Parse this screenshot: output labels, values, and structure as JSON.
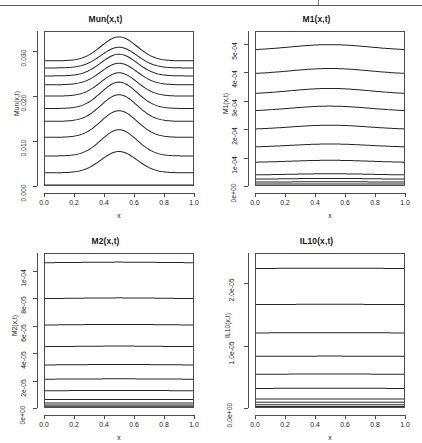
{
  "figure": {
    "kind": "r-multipanel-figure",
    "panel_grid": "2x2",
    "footer_fragment": "",
    "line_color": "#262626",
    "axis_color": "#4d4d4d",
    "background": "#ffffff"
  },
  "chart_data": [
    {
      "id": "mun",
      "type": "line",
      "title": "Mun(x,t)",
      "xlabel": "x",
      "ylabel": "Mun(x,t)",
      "xlim": [
        0.0,
        1.0
      ],
      "ylim": [
        0.0,
        0.0345
      ],
      "grid": false,
      "legend": "none",
      "xticks": [
        "0.0",
        "0.2",
        "0.4",
        "0.6",
        "0.8",
        "1.0"
      ],
      "xtick_values": [
        0.0,
        0.2,
        0.4,
        0.6,
        0.8,
        1.0
      ],
      "yticks": [
        "0.000",
        "0.010",
        "0.020",
        "0.030"
      ],
      "ytick_values": [
        0.0,
        0.01,
        0.02,
        0.03
      ],
      "x": [
        0.0,
        0.05,
        0.1,
        0.15,
        0.2,
        0.25,
        0.3,
        0.35,
        0.4,
        0.45,
        0.5,
        0.55,
        0.6,
        0.65,
        0.7,
        0.75,
        0.8,
        0.85,
        0.9,
        0.95,
        1.0
      ],
      "series": [
        {
          "name": "t0",
          "baseline": 0.0,
          "peak": 0.0
        },
        {
          "name": "t1",
          "baseline": 0.00275,
          "peak": 0.00755
        },
        {
          "name": "t2",
          "baseline": 0.00655,
          "peak": 0.01245
        },
        {
          "name": "t3",
          "baseline": 0.01075,
          "peak": 0.01675
        },
        {
          "name": "t4",
          "baseline": 0.01435,
          "peak": 0.02035
        },
        {
          "name": "t5",
          "baseline": 0.01725,
          "peak": 0.0232
        },
        {
          "name": "t6",
          "baseline": 0.02005,
          "peak": 0.0253
        },
        {
          "name": "t7",
          "baseline": 0.0226,
          "peak": 0.02745
        },
        {
          "name": "t8",
          "baseline": 0.0246,
          "peak": 0.0295
        },
        {
          "name": "t9",
          "baseline": 0.0264,
          "peak": 0.03105
        },
        {
          "name": "t10",
          "baseline": 0.028,
          "peak": 0.0334
        }
      ]
    },
    {
      "id": "m1",
      "type": "line",
      "title": "M1(x,t)",
      "xlabel": "x",
      "ylabel": "M1(x,t)",
      "xlim": [
        0.0,
        1.0
      ],
      "ylim": [
        0.0,
        0.000545
      ],
      "grid": false,
      "legend": "none",
      "xticks": [
        "0.0",
        "0.2",
        "0.4",
        "0.6",
        "0.8",
        "1.0"
      ],
      "xtick_values": [
        0.0,
        0.2,
        0.4,
        0.6,
        0.8,
        1.0
      ],
      "yticks": [
        "0e+00",
        "1e-04",
        "2e-04",
        "3e-04",
        "4e-04",
        "5e-04"
      ],
      "ytick_values": [
        0.0,
        0.0001,
        0.0002,
        0.0003,
        0.0004,
        0.0005
      ],
      "x": [
        0.0,
        0.05,
        0.1,
        0.15,
        0.2,
        0.25,
        0.3,
        0.35,
        0.4,
        0.45,
        0.5,
        0.55,
        0.6,
        0.65,
        0.7,
        0.75,
        0.8,
        0.85,
        0.9,
        0.95,
        1.0
      ],
      "series": [
        {
          "name": "t0",
          "baseline": 3.5e-06,
          "peak": 3.5e-06
        },
        {
          "name": "t1",
          "baseline": 1.05e-05,
          "peak": 1.15e-05
        },
        {
          "name": "t2",
          "baseline": 2.05e-05,
          "peak": 2.35e-05
        },
        {
          "name": "t3",
          "baseline": 3.55e-05,
          "peak": 4e-05
        },
        {
          "name": "t4",
          "baseline": 8e-05,
          "peak": 8.8e-05
        },
        {
          "name": "t5",
          "baseline": 0.000134,
          "peak": 0.000146
        },
        {
          "name": "t6",
          "baseline": 0.000197,
          "peak": 0.000213
        },
        {
          "name": "t7",
          "baseline": 0.000262,
          "peak": 0.000281
        },
        {
          "name": "t8",
          "baseline": 0.000323,
          "peak": 0.000344
        },
        {
          "name": "t9",
          "baseline": 0.000394,
          "peak": 0.000415
        },
        {
          "name": "t10",
          "baseline": 0.000479,
          "peak": 0.0005
        }
      ]
    },
    {
      "id": "m2",
      "type": "line",
      "title": "M2(x,t)",
      "xlabel": "x",
      "ylabel": "M2(x,t)",
      "xlim": [
        0.0,
        1.0
      ],
      "ylim": [
        0.0,
        0.000113
      ],
      "grid": false,
      "legend": "none",
      "xticks": [
        "0.0",
        "0.2",
        "0.4",
        "0.6",
        "0.8",
        "1.0"
      ],
      "xtick_values": [
        0.0,
        0.2,
        0.4,
        0.6,
        0.8,
        1.0
      ],
      "yticks": [
        "0e+00",
        "2e-05",
        "4e-05",
        "6e-05",
        "8e-05",
        "1e-04"
      ],
      "ytick_values": [
        0.0,
        2e-05,
        4e-05,
        6e-05,
        8e-05,
        0.0001
      ],
      "x": [
        0.0,
        0.05,
        0.1,
        0.15,
        0.2,
        0.25,
        0.3,
        0.35,
        0.4,
        0.45,
        0.5,
        0.55,
        0.6,
        0.65,
        0.7,
        0.75,
        0.8,
        0.85,
        0.9,
        0.95,
        1.0
      ],
      "series": [
        {
          "name": "t0",
          "baseline": 5e-07,
          "peak": 5e-07
        },
        {
          "name": "t1",
          "baseline": 1.5e-06,
          "peak": 1.5e-06
        },
        {
          "name": "t2",
          "baseline": 3e-06,
          "peak": 3e-06
        },
        {
          "name": "t3",
          "baseline": 5.5e-06,
          "peak": 5.5e-06
        },
        {
          "name": "t4",
          "baseline": 1.2e-05,
          "peak": 1.22e-05
        },
        {
          "name": "t5",
          "baseline": 2.05e-05,
          "peak": 2.08e-05
        },
        {
          "name": "t6",
          "baseline": 3.1e-05,
          "peak": 3.14e-05
        },
        {
          "name": "t7",
          "baseline": 4.45e-05,
          "peak": 4.5e-05
        },
        {
          "name": "t8",
          "baseline": 6.05e-05,
          "peak": 6.1e-05
        },
        {
          "name": "t9",
          "baseline": 8e-05,
          "peak": 8.06e-05
        },
        {
          "name": "t10",
          "baseline": 0.0001065,
          "peak": 0.000107
        }
      ]
    },
    {
      "id": "il10",
      "type": "line",
      "title": "IL10(x,t)",
      "xlabel": "x",
      "ylabel": "IL10(x,t)",
      "xlim": [
        0.0,
        1.0
      ],
      "ylim": [
        0.0,
        2.48e-05
      ],
      "grid": false,
      "legend": "none",
      "xticks": [
        "0.0",
        "0.2",
        "0.4",
        "0.6",
        "0.8",
        "1.0"
      ],
      "xtick_values": [
        0.0,
        0.2,
        0.4,
        0.6,
        0.8,
        1.0
      ],
      "yticks": [
        "0.0e+00",
        "1.0e-05",
        "2.0e-05"
      ],
      "ytick_values": [
        0.0,
        1e-05,
        2e-05
      ],
      "x": [
        0.0,
        0.05,
        0.1,
        0.15,
        0.2,
        0.25,
        0.3,
        0.35,
        0.4,
        0.45,
        0.5,
        0.55,
        0.6,
        0.65,
        0.7,
        0.75,
        0.8,
        0.85,
        0.9,
        0.95,
        1.0
      ],
      "series": [
        {
          "name": "t0",
          "baseline": 1e-07,
          "peak": 1e-07
        },
        {
          "name": "t1",
          "baseline": 3.5e-07,
          "peak": 3.5e-07
        },
        {
          "name": "t2",
          "baseline": 7.5e-07,
          "peak": 7.5e-07
        },
        {
          "name": "t3",
          "baseline": 1.3e-06,
          "peak": 1.3e-06
        },
        {
          "name": "t4",
          "baseline": 3e-06,
          "peak": 3.05e-06
        },
        {
          "name": "t5",
          "baseline": 5.3e-06,
          "peak": 5.35e-06
        },
        {
          "name": "t6",
          "baseline": 8.2e-06,
          "peak": 8.25e-06
        },
        {
          "name": "t7",
          "baseline": 1.2e-05,
          "peak": 1.205e-05
        },
        {
          "name": "t8",
          "baseline": 1.66e-05,
          "peak": 1.665e-05
        },
        {
          "name": "t9",
          "baseline": 2.245e-05,
          "peak": 2.25e-05
        }
      ]
    }
  ]
}
